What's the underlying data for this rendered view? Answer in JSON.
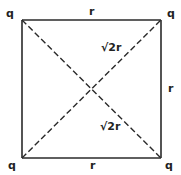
{
  "diagram": {
    "type": "square-charge-configuration",
    "colors": {
      "stroke": "#2a2a2a",
      "text": "#222222",
      "background": "#ffffff"
    },
    "corners": [
      {
        "id": "top-left",
        "label": "q"
      },
      {
        "id": "top-right",
        "label": "q"
      },
      {
        "id": "bottom-left",
        "label": "q"
      },
      {
        "id": "bottom-right",
        "label": "q"
      }
    ],
    "edges": {
      "top": {
        "label": "r"
      },
      "right": {
        "label": "r"
      },
      "bottom": {
        "label": "r"
      },
      "left": {
        "label": ""
      }
    },
    "diagonals": [
      {
        "id": "bottom-left-to-top-right",
        "label": "√2r",
        "style": "dashed"
      },
      {
        "id": "top-left-to-bottom-right",
        "label": "√2r",
        "style": "dashed"
      }
    ]
  }
}
